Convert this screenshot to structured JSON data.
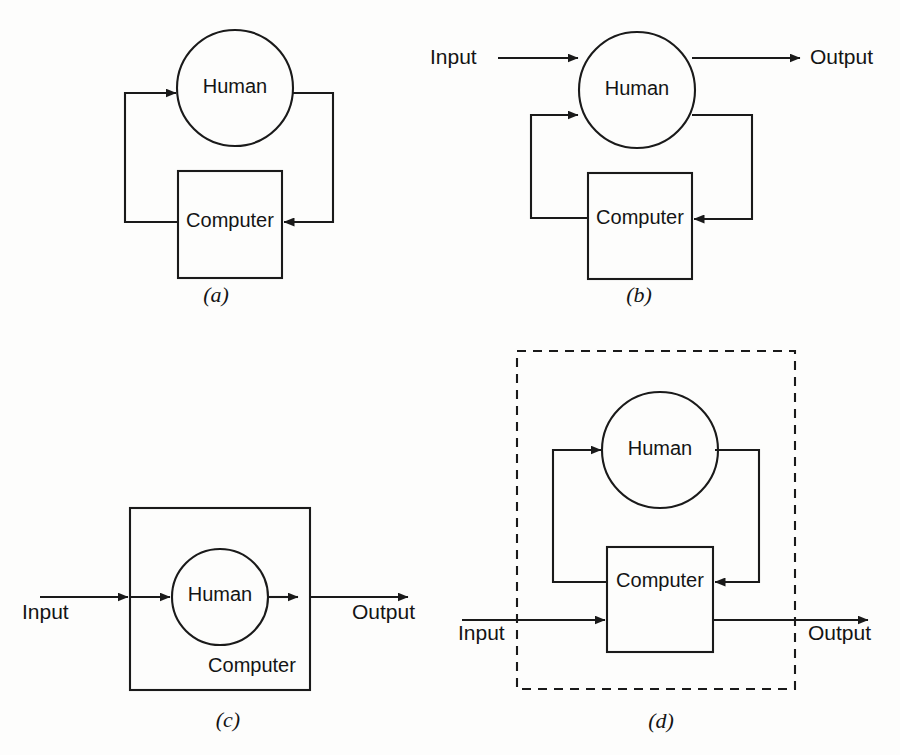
{
  "figure": {
    "background_color": "#fdfdfc",
    "stroke_color": "#1a1a1a",
    "panel_count": 4
  },
  "labels": {
    "human": "Human",
    "computer": "Computer",
    "input": "Input",
    "output": "Output"
  },
  "panels": [
    {
      "id": "a",
      "caption": "(a)",
      "description": "Closed loop: Human and Computer in a feedback loop with no external input or output",
      "nodes": [
        {
          "name": "human",
          "shape": "circle",
          "label": "Human"
        },
        {
          "name": "computer",
          "shape": "rectangle",
          "label": "Computer"
        }
      ],
      "flows": [
        "human-to-computer",
        "computer-to-human"
      ],
      "has_input": false,
      "has_output": false,
      "has_boundary": false
    },
    {
      "id": "b",
      "caption": "(b)",
      "description": "Human receives external Input and produces external Output, with a Computer feedback loop",
      "nodes": [
        {
          "name": "human",
          "shape": "circle",
          "label": "Human"
        },
        {
          "name": "computer",
          "shape": "rectangle",
          "label": "Computer"
        }
      ],
      "flows": [
        "input-to-human",
        "human-to-output",
        "human-to-computer",
        "computer-to-human"
      ],
      "has_input": true,
      "has_output": true,
      "has_boundary": false
    },
    {
      "id": "c",
      "caption": "(c)",
      "description": "Human nested inside the Computer; Input passes through Computer and Human to Output",
      "nodes": [
        {
          "name": "computer",
          "shape": "rectangle",
          "label": "Computer"
        },
        {
          "name": "human",
          "shape": "circle",
          "label": "Human"
        }
      ],
      "flows": [
        "input-to-computer",
        "computer-to-human",
        "human-to-computer-out",
        "computer-to-output"
      ],
      "has_input": true,
      "has_output": true,
      "has_boundary": false
    },
    {
      "id": "d",
      "caption": "(d)",
      "description": "Human and Computer enclosed in a dashed system boundary; Input enters the Computer and Output leaves it",
      "nodes": [
        {
          "name": "human",
          "shape": "circle",
          "label": "Human"
        },
        {
          "name": "computer",
          "shape": "rectangle",
          "label": "Computer"
        }
      ],
      "flows": [
        "input-to-computer",
        "computer-to-output",
        "computer-to-human",
        "human-to-computer"
      ],
      "has_input": true,
      "has_output": true,
      "has_boundary": true
    }
  ]
}
